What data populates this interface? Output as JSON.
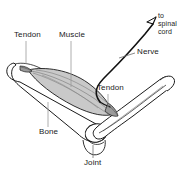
{
  "diagram": {
    "type": "anatomical-line-drawing",
    "background_color": "#ffffff",
    "line_color": "#1a1a1a",
    "muscle_fill_color": "#c9c9c9",
    "bone_fill_color": "#ffffff",
    "nerve_color": "#111111",
    "leader_line_color": "#8c8c8c",
    "labels": {
      "tendon_left": "Tendon",
      "muscle": "Muscle",
      "tendon_right": "Tendon",
      "nerve": "Nerve",
      "bone": "Bone",
      "joint": "Joint",
      "spinal_cord_line1": "to",
      "spinal_cord_line2": "spinal",
      "spinal_cord_line3": "cord"
    }
  }
}
